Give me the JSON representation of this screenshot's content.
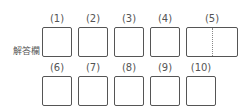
{
  "answer_sheet": {
    "label": "解答欄",
    "row1": [
      {
        "number": "(1)"
      },
      {
        "number": "(2)"
      },
      {
        "number": "(3)"
      },
      {
        "number": "(4)"
      },
      {
        "number": "(5)"
      }
    ],
    "row2": [
      {
        "number": "(6)"
      },
      {
        "number": "(7)"
      },
      {
        "number": "(8)"
      },
      {
        "number": "(9)"
      },
      {
        "number": "(10)"
      }
    ]
  }
}
